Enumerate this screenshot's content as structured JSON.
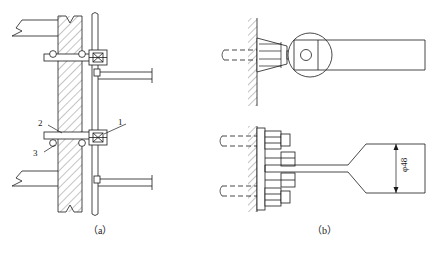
{
  "drawing": {
    "type": "engineering-detail-drawing",
    "description": "Cladding panel anchor connection detail: vertical section and plan views",
    "line_color": "#1a1a1a",
    "background_color": "#ffffff",
    "hatch_color": "#555555"
  },
  "figures": [
    {
      "id": "a",
      "caption": "（a）",
      "view": "vertical-section",
      "callouts": [
        {
          "id": "1",
          "label": "1",
          "points_to": "bolt-connector-detail"
        },
        {
          "id": "2",
          "label": "2",
          "points_to": "anchor-plate"
        },
        {
          "id": "3",
          "label": "3",
          "points_to": "round-bar-anchor"
        }
      ]
    },
    {
      "id": "b",
      "caption": "（b）",
      "view": "plan-detail",
      "dimensions": [
        {
          "label": "φ48",
          "value": 48,
          "unit": "mm",
          "applies_to": "flared-end-width"
        }
      ]
    }
  ],
  "labels": {
    "caption_a": "（a）",
    "caption_b": "（b）",
    "callout_1": "1",
    "callout_2": "2",
    "callout_3": "3",
    "dim_phi48": "φ48"
  }
}
